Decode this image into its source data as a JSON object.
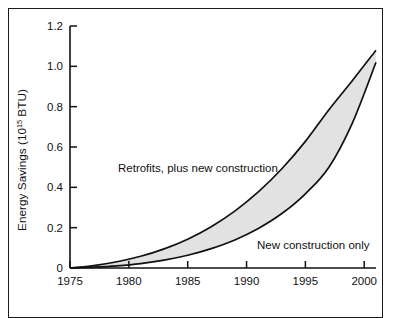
{
  "chart_data": {
    "type": "area",
    "title": "",
    "xlabel": "",
    "ylabel": "Energy Savings (10^15 BTU)",
    "ylabel_base": "Energy Savings (10",
    "ylabel_exp": "15",
    "ylabel_tail": " BTU)",
    "xlim": [
      1975,
      2001
    ],
    "ylim": [
      0,
      1.2
    ],
    "grid": false,
    "legend_position": "inline-annotations",
    "x_ticks": [
      1975,
      1980,
      1985,
      1990,
      1995,
      2000
    ],
    "x_tick_labels": [
      "1975",
      "1980",
      "1985",
      "1990",
      "1995",
      "2000"
    ],
    "y_ticks": [
      0,
      0.2,
      0.4,
      0.6,
      0.8,
      1.0,
      1.2
    ],
    "y_tick_labels": [
      "0",
      "0.2",
      "0.4",
      "0.6",
      "0.8",
      "1.0",
      "1.2"
    ],
    "x": [
      1975,
      1977,
      1979,
      1981,
      1983,
      1985,
      1987,
      1989,
      1991,
      1993,
      1995,
      1997,
      1999,
      2001
    ],
    "series": [
      {
        "name": "Retrofits, plus new construction",
        "role": "upper-bound",
        "values": [
          0.0,
          0.012,
          0.031,
          0.058,
          0.095,
          0.143,
          0.205,
          0.282,
          0.377,
          0.492,
          0.628,
          0.785,
          0.93,
          1.08
        ]
      },
      {
        "name": "New construction only",
        "role": "lower-bound",
        "values": [
          0.0,
          0.004,
          0.011,
          0.022,
          0.039,
          0.063,
          0.096,
          0.139,
          0.196,
          0.27,
          0.368,
          0.5,
          0.72,
          1.02
        ]
      }
    ],
    "band_fill_color": "#e2e2e2",
    "curve_color": "#111111",
    "annotations": [
      {
        "id": "upper-band-label",
        "text": "Retrofits, plus new construction",
        "x_px": 118,
        "y_px": 172
      },
      {
        "id": "lower-band-label",
        "text": "New construction only",
        "x_px": 257,
        "y_px": 249
      }
    ]
  },
  "figure": {
    "frame_color": "#1a1a1a",
    "background_color": "#ffffff"
  }
}
